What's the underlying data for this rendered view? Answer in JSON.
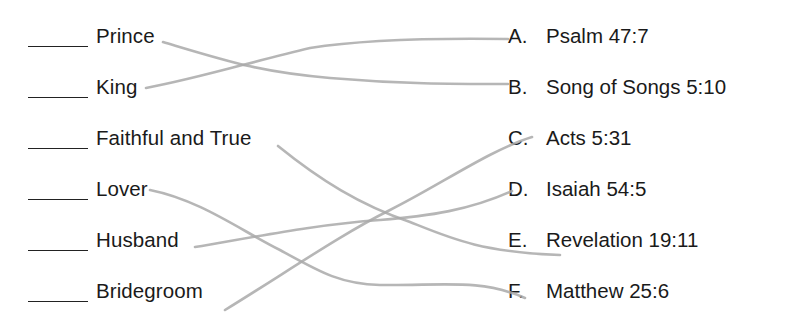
{
  "worksheet": {
    "terms": [
      {
        "label": "Prince",
        "blank": ""
      },
      {
        "label": "King",
        "blank": ""
      },
      {
        "label": "Faithful and True",
        "blank": ""
      },
      {
        "label": "Lover",
        "blank": ""
      },
      {
        "label": "Husband",
        "blank": ""
      },
      {
        "label": "Bridegroom",
        "blank": ""
      }
    ],
    "references": [
      {
        "letter": "A.",
        "text": "Psalm 47:7"
      },
      {
        "letter": "B.",
        "text": "Song of Songs 5:10"
      },
      {
        "letter": "C.",
        "text": "Acts 5:31"
      },
      {
        "letter": "D.",
        "text": "Isaiah 54:5"
      },
      {
        "letter": "E.",
        "text": "Revelation 19:11"
      },
      {
        "letter": "F.",
        "text": "Matthew 25:6"
      }
    ],
    "pencil_matches": [
      {
        "term": "Prince",
        "reference": "B."
      },
      {
        "term": "King",
        "reference": "A."
      },
      {
        "term": "Faithful and True",
        "reference": "E."
      },
      {
        "term": "Lover",
        "reference": "F."
      },
      {
        "term": "Husband",
        "reference": "D."
      },
      {
        "term": "Bridegroom",
        "reference": "C."
      }
    ],
    "colors": {
      "text": "#1a1a1a",
      "pencil": "#a9a9a9",
      "background": "#ffffff"
    }
  }
}
